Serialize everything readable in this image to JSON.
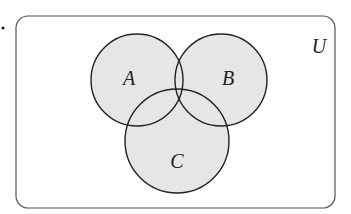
{
  "diagram": {
    "type": "venn",
    "universe": {
      "label": "U",
      "x": 16,
      "y": 16,
      "width": 319,
      "height": 192,
      "radius": 12,
      "label_pos": [
        319,
        53
      ]
    },
    "sets": [
      {
        "label": "A",
        "cx": 137,
        "cy": 80,
        "r": 46,
        "label_pos": [
          129,
          85
        ]
      },
      {
        "label": "B",
        "cx": 221,
        "cy": 80,
        "r": 46,
        "label_pos": [
          228,
          85
        ]
      },
      {
        "label": "C",
        "cx": 177,
        "cy": 141,
        "r": 52,
        "label_pos": [
          177,
          168
        ]
      }
    ],
    "bullet": {
      "cx": 3,
      "cy": 28,
      "r": 1.6
    },
    "colors": {
      "circle_fill": "#e6e6e6",
      "stroke": "#222222",
      "universe_stroke": "#555555",
      "background": "#ffffff"
    }
  }
}
